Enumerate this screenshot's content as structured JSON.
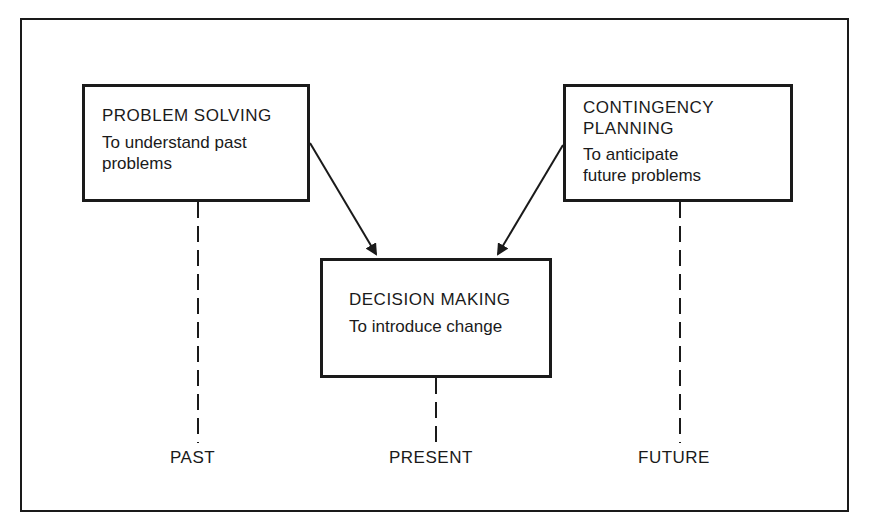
{
  "diagram": {
    "boxes": {
      "problem_solving": {
        "title": "PROBLEM SOLVING",
        "description": "To understand past\nproblems"
      },
      "contingency_planning": {
        "title": "CONTINGENCY\nPLANNING",
        "description": "To anticipate\nfuture problems"
      },
      "decision_making": {
        "title": "DECISION MAKING",
        "description": "To introduce change"
      }
    },
    "timeline": {
      "past": "PAST",
      "present": "PRESENT",
      "future": "FUTURE"
    },
    "colors": {
      "ink": "#1a1a1a",
      "background": "#ffffff"
    }
  }
}
